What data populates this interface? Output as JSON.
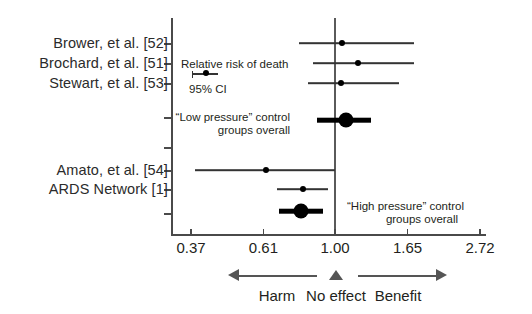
{
  "chart_data": {
    "type": "scatter",
    "subtype": "forest-plot",
    "title": "",
    "xlabel": "",
    "ylabel": "",
    "xscale": "log",
    "xlim": [
      0.33,
      3.05
    ],
    "grid": false,
    "legend": "none",
    "null_value": 1.0,
    "xticks": [
      "0.37",
      "0.61",
      "1.00",
      "1.65",
      "2.72"
    ],
    "xtick_values": [
      0.37,
      0.61,
      1.0,
      1.65,
      2.72
    ],
    "rows": [
      {
        "label": "Brower, et al. [52]",
        "estimate": 1.05,
        "ci_low": 0.78,
        "ci_high": 1.72,
        "kind": "study",
        "group": "low-pressure"
      },
      {
        "label": "Brochard, et al. [51]",
        "estimate": 1.17,
        "ci_low": 0.86,
        "ci_high": 1.72,
        "kind": "study",
        "group": "low-pressure"
      },
      {
        "label": "Stewart, et al. [53]",
        "estimate": 1.04,
        "ci_low": 0.83,
        "ci_high": 1.55,
        "kind": "study",
        "group": "low-pressure"
      },
      {
        "label": "",
        "estimate": 1.08,
        "ci_low": 0.88,
        "ci_high": 1.28,
        "kind": "summary",
        "group": "low-pressure",
        "annotation": "“Low pressure” control groups overall"
      },
      {
        "label": "Amato, et al. [54]",
        "estimate": 0.62,
        "ci_low": 0.38,
        "ci_high": 1.0,
        "kind": "study",
        "group": "high-pressure"
      },
      {
        "label": "ARDS Network [1]",
        "estimate": 0.8,
        "ci_low": 0.67,
        "ci_high": 0.95,
        "kind": "study",
        "group": "high-pressure"
      },
      {
        "label": "",
        "estimate": 0.79,
        "ci_low": 0.68,
        "ci_high": 0.92,
        "kind": "summary",
        "group": "high-pressure",
        "annotation": "“High pressure” control groups overall"
      }
    ],
    "annotations": {
      "callout_line1": "Relative risk of death",
      "callout_line2": "95% CI",
      "summary_low_line1": "“Low pressure” control",
      "summary_low_line2": "groups overall",
      "summary_high_line1": "“High pressure” control",
      "summary_high_line2": "groups overall"
    },
    "direction_legend": {
      "harm_label": "Harm",
      "no_effect_label": "No effect",
      "benefit_label": "Benefit"
    },
    "colors": {
      "marker": "#000000",
      "ci_line": "#333333",
      "axis": "#4a4a4a",
      "null_line": "#5a5a5a",
      "text": "#231f20",
      "background": "#ffffff"
    }
  }
}
